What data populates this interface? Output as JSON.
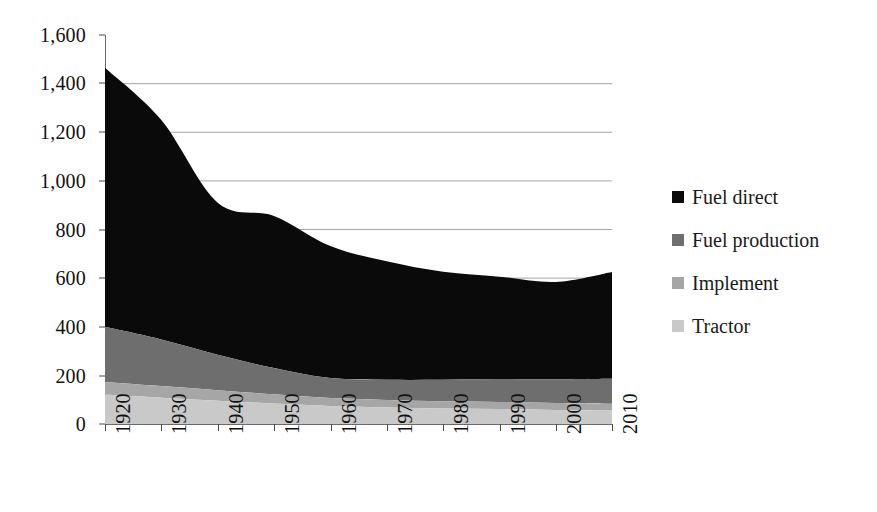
{
  "chart_data": {
    "type": "area",
    "stacked": true,
    "title": "",
    "xlabel": "",
    "ylabel": "",
    "x": [
      1920,
      1930,
      1940,
      1950,
      1960,
      1970,
      1980,
      1990,
      2000,
      2010
    ],
    "categories": [
      "1920",
      "1930",
      "1940",
      "1950",
      "1960",
      "1970",
      "1980",
      "1990",
      "2000",
      "2010"
    ],
    "xlim": [
      1920,
      2010
    ],
    "ylim": [
      0,
      1600
    ],
    "ytick_labels": [
      "0",
      "200",
      "400",
      "600",
      "800",
      "1,000",
      "1,200",
      "1,400",
      "1,600"
    ],
    "ytick_values": [
      0,
      200,
      400,
      600,
      800,
      1000,
      1200,
      1400,
      1600
    ],
    "grid": "horizontal",
    "gridlines_at": [
      200,
      400,
      600,
      800,
      1000,
      1200,
      1400
    ],
    "legend_position": "right",
    "series": [
      {
        "name": "Tractor",
        "color": "#c9c9c9",
        "values": [
          120,
          108,
          96,
          84,
          74,
          68,
          64,
          62,
          58,
          56
        ]
      },
      {
        "name": "Implement",
        "color": "#a6a6a6",
        "values": [
          53,
          48,
          43,
          38,
          33,
          31,
          30,
          29,
          28,
          27
        ]
      },
      {
        "name": "Fuel production",
        "color": "#6e6e6e",
        "values": [
          227,
          192,
          146,
          108,
          82,
          83,
          88,
          94,
          98,
          103
        ]
      },
      {
        "name": "Fuel direct",
        "color": "#0a0a0a",
        "values": [
          1065,
          902,
          625,
          626,
          543,
          487,
          444,
          421,
          400,
          439
        ]
      }
    ],
    "stack_totals": [
      1465,
      1250,
      910,
      856,
      732,
      669,
      626,
      606,
      584,
      625
    ]
  },
  "legend": {
    "items": [
      {
        "label": "Fuel direct",
        "color": "#0a0a0a"
      },
      {
        "label": "Fuel production",
        "color": "#6e6e6e"
      },
      {
        "label": "Implement",
        "color": "#a6a6a6"
      },
      {
        "label": "Tractor",
        "color": "#c9c9c9"
      }
    ]
  },
  "axes": {
    "y_labels": [
      "1,600",
      "1,400",
      "1,200",
      "1,000",
      "800",
      "600",
      "400",
      "200",
      "0"
    ],
    "x_labels": [
      "1920",
      "1930",
      "1940",
      "1950",
      "1960",
      "1970",
      "1980",
      "1990",
      "2000",
      "2010"
    ]
  },
  "colors": {
    "axis": "#6a6a6a",
    "grid": "#8f8f8f",
    "text": "#111111",
    "background": "#ffffff"
  }
}
